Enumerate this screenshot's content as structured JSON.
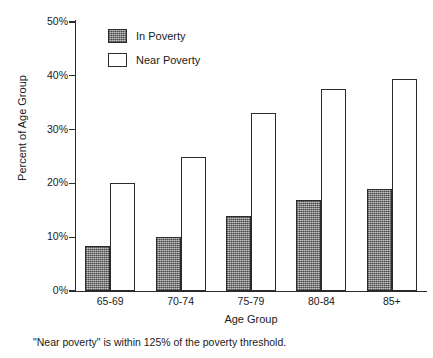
{
  "chart_data": {
    "type": "bar",
    "title": "",
    "xlabel": "Age Group",
    "ylabel": "Percent of Age Group",
    "categories": [
      "65-69",
      "70-74",
      "75-79",
      "80-84",
      "85+"
    ],
    "series": [
      {
        "name": "In Poverty",
        "color": "#949494",
        "values": [
          8.3,
          10,
          14,
          17,
          19
        ]
      },
      {
        "name": "Near Poverty",
        "color": "#ffffff",
        "values": [
          20,
          25,
          33,
          37.5,
          39.5
        ]
      }
    ],
    "ylim": [
      0,
      50
    ],
    "ytick_values": [
      0,
      10,
      20,
      30,
      40,
      50
    ],
    "ytick_labels": [
      "0%",
      "10%",
      "20%",
      "30%",
      "40%",
      "50%"
    ],
    "grid": false,
    "legend_position": "top-left-inside",
    "annotations": [
      "\"Near poverty\" is within 125% of the poverty threshold."
    ]
  },
  "axes": {
    "y_title": "Percent of Age Group",
    "x_title": "Age Group",
    "ticks": [
      {
        "label": "50%",
        "value": 50
      },
      {
        "label": "40%",
        "value": 40
      },
      {
        "label": "30%",
        "value": 30
      },
      {
        "label": "20%",
        "value": 20
      },
      {
        "label": "10%",
        "value": 10
      },
      {
        "label": "0%",
        "value": 0
      }
    ],
    "categories": [
      {
        "label": "65-69"
      },
      {
        "label": "70-74"
      },
      {
        "label": "75-79"
      },
      {
        "label": "80-84"
      },
      {
        "label": "85+"
      }
    ]
  },
  "legend": {
    "items": [
      {
        "label": "In Poverty",
        "swatch": "filled-gray"
      },
      {
        "label": "Near Poverty",
        "swatch": "outline-white"
      }
    ]
  },
  "footnote": {
    "text": "\"Near poverty\" is within 125% of the poverty threshold."
  }
}
